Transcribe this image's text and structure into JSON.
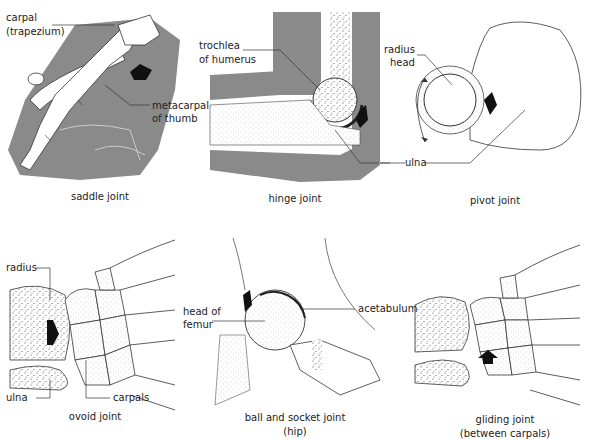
{
  "diagram": {
    "colors": {
      "background": "#ffffff",
      "soft_tissue_gray": "#8a8a8a",
      "bone_fill": "#ffffff",
      "outline": "#333333",
      "arrow": "#111111",
      "stipple": "#555555"
    },
    "panels": [
      {
        "id": "saddle",
        "caption": "saddle joint",
        "labels": [
          "carpal",
          "(trapezium)",
          "metacarpal",
          "of thumb"
        ]
      },
      {
        "id": "hinge",
        "caption": "hinge joint",
        "labels": [
          "trochlea",
          "of humerus",
          "ulna"
        ]
      },
      {
        "id": "pivot",
        "caption": "pivot joint",
        "labels": [
          "radius",
          "head",
          "ulna"
        ]
      },
      {
        "id": "ovoid",
        "caption": "ovoid joint",
        "labels": [
          "radius",
          "ulna",
          "carpals"
        ]
      },
      {
        "id": "ball-socket",
        "caption": "ball and socket joint",
        "caption2": "(hip)",
        "labels": [
          "head of",
          "femur",
          "acetabulum"
        ]
      },
      {
        "id": "gliding",
        "caption": "gliding joint",
        "caption2": "(between carpals)",
        "labels": []
      }
    ]
  }
}
